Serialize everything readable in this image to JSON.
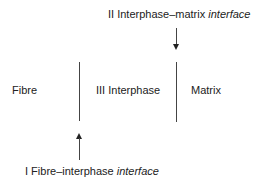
{
  "regions": {
    "fibre": "Fibre",
    "interphase": "III Interphase",
    "matrix": "Matrix"
  },
  "labels": {
    "top": {
      "prefix": "II Interphase–matrix ",
      "italic": "interface"
    },
    "bottom": {
      "prefix": "I Fibre–interphase ",
      "italic": "interface"
    }
  }
}
